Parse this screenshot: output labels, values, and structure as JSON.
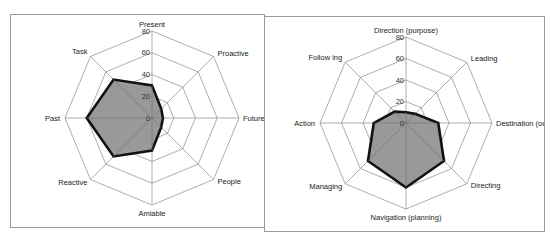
{
  "chart_data": [
    {
      "type": "radar",
      "title": "",
      "categories": [
        "Present",
        "Proactive",
        "Future",
        "People",
        "Amiable",
        "Reactive",
        "Past",
        "Task"
      ],
      "series": [
        {
          "name": "Series 1",
          "values": [
            30,
            12,
            10,
            12,
            30,
            50,
            60,
            50
          ]
        }
      ],
      "rlim": [
        0,
        80
      ],
      "ticks": [
        "0",
        "20",
        "40",
        "60",
        "80"
      ],
      "fill_color": "#999999",
      "line_color": "#111111",
      "grid": true,
      "legend": "none"
    },
    {
      "type": "radar",
      "title": "",
      "categories": [
        "Direction (purpose)",
        "Leading",
        "Destination (outco",
        "Directing",
        "Navigation (planning)",
        "Managing",
        "Action",
        "Follow ing"
      ],
      "series": [
        {
          "name": "Series 1",
          "values": [
            10,
            12,
            30,
            50,
            60,
            50,
            30,
            15
          ]
        }
      ],
      "rlim": [
        0,
        80
      ],
      "ticks": [
        "0",
        "20",
        "40",
        "60",
        "80"
      ],
      "fill_color": "#999999",
      "line_color": "#111111",
      "grid": true,
      "legend": "none"
    }
  ]
}
